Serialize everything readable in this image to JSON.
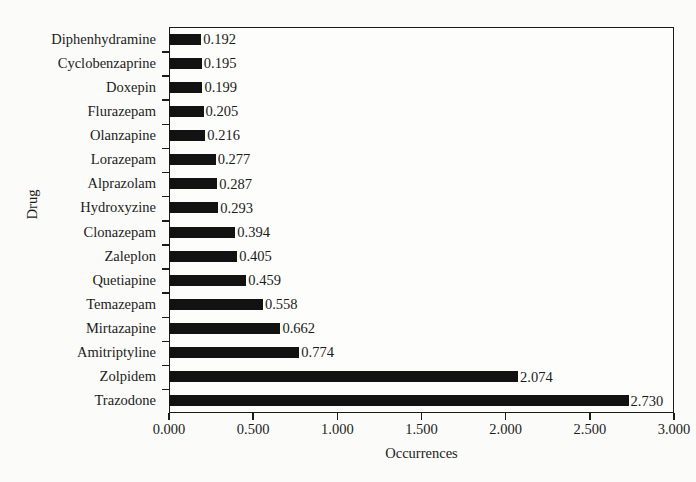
{
  "chart_data": {
    "type": "bar",
    "orientation": "horizontal",
    "title": "",
    "xlabel": "Occurrences",
    "ylabel": "Drug",
    "xlim": [
      0.0,
      3.0
    ],
    "xticks": [
      "0.000",
      "0.500",
      "1.000",
      "1.500",
      "2.000",
      "2.500",
      "3.000"
    ],
    "xtick_values": [
      0.0,
      0.5,
      1.0,
      1.5,
      2.0,
      2.5,
      3.0
    ],
    "grid": false,
    "legend": false,
    "bar_color": "#121212",
    "categories": [
      "Diphenhydramine",
      "Cyclobenzaprine",
      "Doxepin",
      "Flurazepam",
      "Olanzapine",
      "Lorazepam",
      "Alprazolam",
      "Hydroxyzine",
      "Clonazepam",
      "Zaleplon",
      "Quetiapine",
      "Temazepam",
      "Mirtazapine",
      "Amitriptyline",
      "Zolpidem",
      "Trazodone"
    ],
    "values": [
      0.192,
      0.195,
      0.199,
      0.205,
      0.216,
      0.277,
      0.287,
      0.293,
      0.394,
      0.405,
      0.459,
      0.558,
      0.662,
      0.774,
      2.074,
      2.73
    ],
    "data_labels": [
      "0.192",
      "0.195",
      "0.199",
      "0.205",
      "0.216",
      "0.277",
      "0.287",
      "0.293",
      "0.394",
      "0.405",
      "0.459",
      "0.558",
      "0.662",
      "0.774",
      "2.074",
      "2.730"
    ]
  }
}
